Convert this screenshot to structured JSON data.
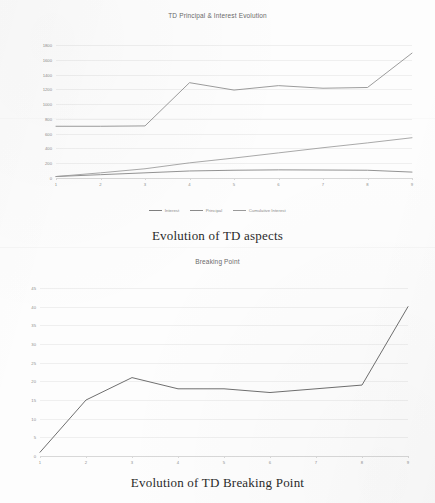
{
  "page": {
    "background_color": "#fdfdfd",
    "ink_color": "#2a2a2a"
  },
  "figure_one": {
    "caption": "Evolution of TD aspects",
    "chart_data": {
      "type": "line",
      "title": "TD Principal & Interest Evolution",
      "xlabel": "",
      "ylabel": "",
      "x": [
        1,
        2,
        3,
        4,
        5,
        6,
        7,
        8,
        9
      ],
      "categories": [
        "1",
        "2",
        "3",
        "4",
        "5",
        "6",
        "7",
        "8",
        "9"
      ],
      "xtick_labels": [
        "1",
        "2",
        "3",
        "4",
        "5",
        "6",
        "7",
        "8",
        "9"
      ],
      "ytick_labels": [
        "0",
        "200",
        "400",
        "600",
        "800",
        "1000",
        "1200",
        "1400",
        "1600",
        "1800"
      ],
      "yticks": [
        0,
        200,
        400,
        600,
        800,
        1000,
        1200,
        1400,
        1600,
        1800
      ],
      "ylim": [
        0,
        1800
      ],
      "grid": true,
      "legend_position": "bottom",
      "series": [
        {
          "name": "Interest",
          "color": "#7f7f7f",
          "values": [
            20,
            45,
            70,
            95,
            105,
            110,
            108,
            105,
            80
          ]
        },
        {
          "name": "Principal",
          "color": "#8a8a8a",
          "values": [
            700,
            700,
            705,
            1290,
            1190,
            1250,
            1215,
            1225,
            1690
          ]
        },
        {
          "name": "Cumulative Interest",
          "color": "#9a9a9a",
          "values": [
            20,
            70,
            125,
            205,
            270,
            340,
            410,
            475,
            545
          ]
        }
      ]
    }
  },
  "figure_two": {
    "caption": "Evolution of TD Breaking Point",
    "chart_data": {
      "type": "line",
      "title": "Breaking Point",
      "xlabel": "",
      "ylabel": "",
      "x": [
        1,
        2,
        3,
        4,
        5,
        6,
        7,
        8,
        9
      ],
      "categories": [
        "1",
        "2",
        "3",
        "4",
        "5",
        "6",
        "7",
        "8",
        "9"
      ],
      "xtick_labels": [
        "1",
        "2",
        "3",
        "4",
        "5",
        "6",
        "7",
        "8",
        "9"
      ],
      "ytick_labels": [
        "0",
        "5",
        "10",
        "15",
        "20",
        "25",
        "30",
        "35",
        "40",
        "45"
      ],
      "yticks": [
        0,
        5,
        10,
        15,
        20,
        25,
        30,
        35,
        40,
        45
      ],
      "ylim": [
        0,
        45
      ],
      "grid": true,
      "legend_position": "none",
      "series": [
        {
          "name": "Breaking Point",
          "color": "#6f6f6f",
          "values": [
            1,
            15,
            21,
            18,
            18,
            17,
            18,
            19,
            40
          ]
        }
      ]
    }
  }
}
